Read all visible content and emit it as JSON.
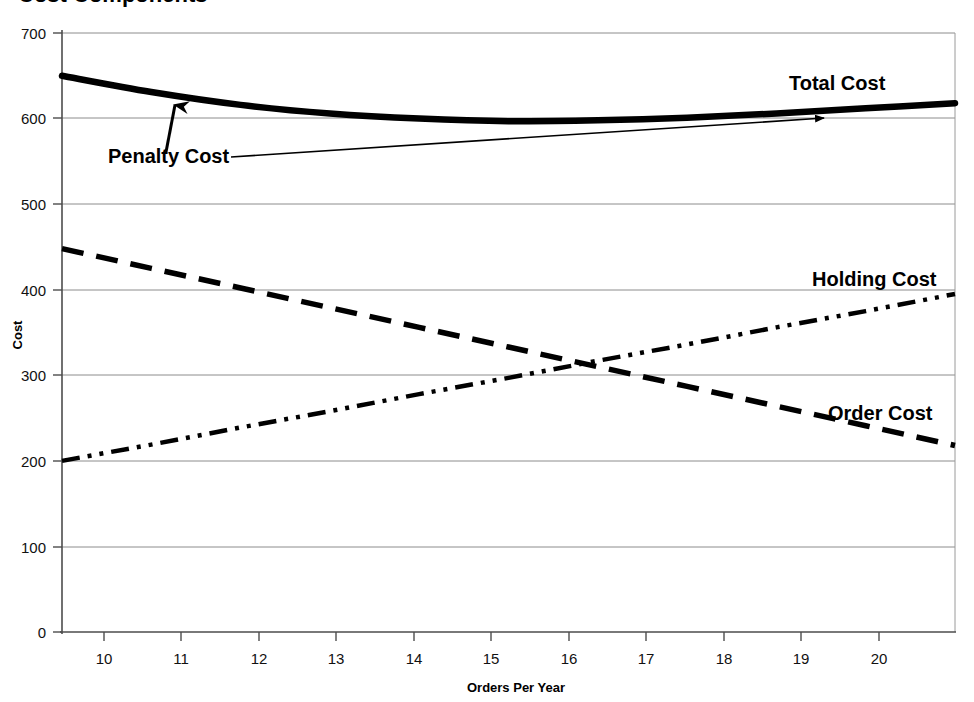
{
  "chart_data": {
    "type": "line",
    "title": "Cost Components",
    "title_clipped": true,
    "xlabel": "Orders Per Year",
    "ylabel": "Cost",
    "xlim": [
      10,
      20
    ],
    "ylim": [
      0,
      700
    ],
    "ytick_step": 100,
    "xticks": [
      "10",
      "11",
      "12",
      "13",
      "14",
      "15",
      "16",
      "17",
      "18",
      "19",
      "20"
    ],
    "yticks": [
      "0",
      "100",
      "200",
      "300",
      "400",
      "500",
      "600",
      "700"
    ],
    "grid": "horizontal",
    "legend": "inline-labels",
    "x": [
      10,
      11,
      12,
      13,
      14,
      15,
      16,
      17,
      18,
      19,
      20
    ],
    "series": [
      {
        "name": "Total Cost",
        "style": "solid-thick",
        "values": [
          650,
          631,
          616,
          606,
          600,
          597,
          598,
          601,
          606,
          612,
          618
        ]
      },
      {
        "name": "Order Cost",
        "style": "dashed",
        "values": [
          448,
          425,
          402,
          379,
          356,
          333,
          310,
          287,
          264,
          241,
          218
        ]
      },
      {
        "name": "Holding Cost",
        "style": "dash-dot-dot",
        "values": [
          200,
          219,
          239,
          258,
          278,
          297,
          317,
          336,
          356,
          375,
          395
        ]
      },
      {
        "name": "Penalty Cost",
        "style": "thin-line-with-arrow",
        "values": [
          520,
          530,
          540,
          550,
          560,
          568,
          576,
          583,
          589,
          594,
          597
        ]
      }
    ],
    "annotations": [
      {
        "text": "Total Cost",
        "target_series": "Total Cost"
      },
      {
        "text": "Penalty Cost",
        "target_series": "Penalty Cost"
      },
      {
        "text": "Holding Cost",
        "target_series": "Holding Cost"
      },
      {
        "text": "Order Cost",
        "target_series": "Order Cost"
      }
    ]
  },
  "labels": {
    "total_cost": "Total Cost",
    "penalty_cost": "Penalty Cost",
    "holding_cost": "Holding Cost",
    "order_cost": "Order Cost"
  },
  "axes": {
    "y_title": "Cost",
    "x_title": "Orders Per Year",
    "y_ticks": [
      "700",
      "600",
      "500",
      "400",
      "300",
      "200",
      "100",
      "0"
    ],
    "x_ticks": [
      "10",
      "11",
      "12",
      "13",
      "14",
      "15",
      "16",
      "17",
      "18",
      "19",
      "20"
    ]
  },
  "colors": {
    "line": "#000000",
    "grid": "#808080",
    "axis": "#4d4d4d",
    "background": "#ffffff"
  }
}
